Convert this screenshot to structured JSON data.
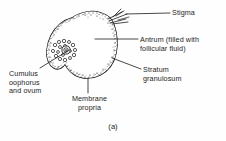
{
  "figure": {
    "caption": "(a)",
    "background_color": "#fefefe",
    "ink_color": "#1d1d1d"
  },
  "labels": {
    "stigma": "Stigma",
    "antrum": "Antrum (filled with\nfollicular fluid)",
    "stratum_granulosum": "Stratum\ngranulosum",
    "cumulus_oophorus": "Cumulus\noophorus\nand ovum",
    "membrane_propria": "Membrane\npropria"
  },
  "structures": [
    {
      "name": "stigma",
      "description": "ruptured apex with radiating fibers at upper right of follicle"
    },
    {
      "name": "antrum",
      "description": "large clear cavity filled with follicular fluid"
    },
    {
      "name": "stratum-granulosum",
      "description": "stippled granulosa cell layer lining the follicle wall"
    },
    {
      "name": "cumulus-oophorus",
      "description": "mound of granulosa cells on left wall bearing the ovum"
    },
    {
      "name": "ovum",
      "description": "central egg cell within the cumulus oophorus"
    },
    {
      "name": "membrane-propria",
      "description": "outer boundary membrane of the follicle"
    }
  ]
}
